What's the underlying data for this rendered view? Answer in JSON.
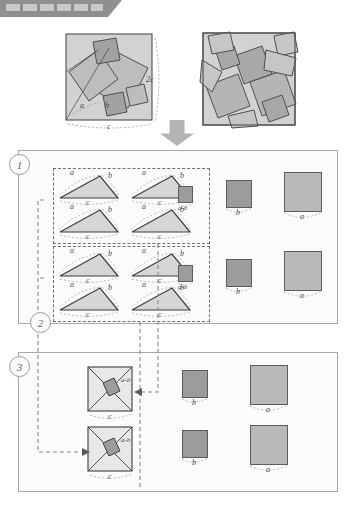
{
  "header": {
    "redaction_label": "redacted-title-bar",
    "block_count": 6
  },
  "figure": {
    "title_hidden": true,
    "top": {
      "left_diagram": {
        "name": "dissected-square-diagram",
        "labels": {
          "side_right": "2c",
          "side_bottom": "c",
          "leg_a": "a",
          "leg_b": "b"
        }
      },
      "right_diagram": {
        "name": "pythagorean-tiling-pattern",
        "labels": {}
      },
      "arrow": "down-arrow"
    },
    "sections": [
      {
        "number": "1",
        "group": {
          "triangles": [
            {
              "a": "a",
              "b": "b",
              "c": "c"
            },
            {
              "a": "a",
              "b": "b",
              "c": "c"
            },
            {
              "a": "a",
              "b": "b",
              "c": "c"
            },
            {
              "a": "a",
              "b": "b",
              "c": "c"
            }
          ],
          "inner_square": {
            "label": "a-b",
            "size": 14,
            "shade": "dk"
          }
        },
        "squares": [
          {
            "label": "b",
            "size": 26,
            "shade": "dk"
          },
          {
            "label": "a",
            "size": 38,
            "shade": "lt"
          }
        ]
      },
      {
        "number": "2",
        "group": {
          "triangles": [
            {
              "a": "a",
              "b": "b",
              "c": "c"
            },
            {
              "a": "a",
              "b": "b",
              "c": "c"
            },
            {
              "a": "a",
              "b": "b",
              "c": "c"
            },
            {
              "a": "a",
              "b": "b",
              "c": "c"
            }
          ],
          "inner_square": {
            "label": "a-b",
            "size": 14,
            "shade": "dk"
          }
        },
        "squares": [
          {
            "label": "b",
            "size": 26,
            "shade": "dk"
          },
          {
            "label": "a",
            "size": 38,
            "shade": "lt"
          }
        ]
      },
      {
        "number": "3",
        "rows": [
          {
            "composite": {
              "label_inner": "a-b",
              "label_bottom": "c"
            },
            "squares": [
              {
                "label": "b",
                "size": 26,
                "shade": "dk"
              },
              {
                "label": "a",
                "size": 38,
                "shade": "lt"
              }
            ]
          },
          {
            "composite": {
              "label_inner": "a-b",
              "label_bottom": "c"
            },
            "squares": [
              {
                "label": "b",
                "size": 26,
                "shade": "dk"
              },
              {
                "label": "a",
                "size": 38,
                "shade": "lt"
              }
            ]
          }
        ]
      }
    ],
    "colors": {
      "light_fill": "#c3c3c3",
      "mid_fill": "#b9b9b9",
      "dark_fill": "#9c9c9c",
      "stroke": "#5d5d5d",
      "panel_border": "#a8a8a8",
      "dashed": "#6f6f6f",
      "arrow": "#b4b4b4"
    }
  }
}
